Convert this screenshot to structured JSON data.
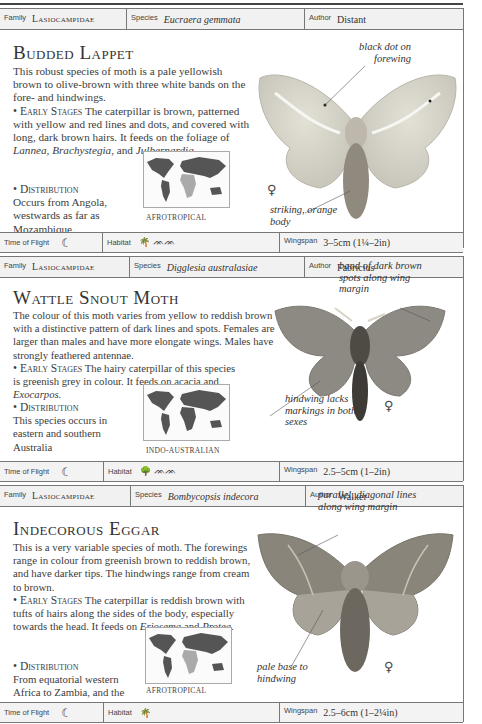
{
  "labels": {
    "family": "Family",
    "species": "Species",
    "author": "Author",
    "time_of_flight": "Time of Flight",
    "habitat": "Habitat",
    "wingspan": "Wingspan"
  },
  "entries": [
    {
      "family": "Lasiocampidae",
      "species": "Eucraera gemmata",
      "author": "Distant",
      "title": "Budded Lappet",
      "description": "This robust species of moth is a pale yellowish brown to olive-brown with three white bands on the fore- and hindwings.",
      "early_stages_heading": "• Early Stages",
      "early_stages_text_1": " The caterpillar is brown, patterned with yellow and red lines and dots, and covered with long, dark brown hairs. It feeds on the foliage of ",
      "early_stages_italic": "Lannea, Brachystegia,",
      "early_stages_text_2": " and ",
      "early_stages_italic_2": "Julbernardia.",
      "distribution_heading": "• Distribution",
      "distribution_text": "Occurs from Angola, westwards as far as Mozambique.",
      "map_label": "AFROTROPICAL",
      "annotations": [
        "black dot on forewing",
        "striking, orange body"
      ],
      "sex_symbol": "♀",
      "time_of_flight_icon": "☾",
      "habitat_icons": "🌴 ᨏᨏ",
      "wingspan": "3–5cm (1¼–2in)"
    },
    {
      "family": "Lasiocampidae",
      "species": "Digglesia australasiae",
      "author": "Fabricius",
      "title": "Wattle Snout Moth",
      "description": "The colour of this moth varies from yellow to reddish brown with a distinctive pattern of dark lines and spots. Females are larger than males and have more elongate wings. Males have strongly feathered antennae.",
      "early_stages_heading": "• Early Stages",
      "early_stages_text_1": " The hairy caterpillar of this species is greenish grey in colour. It feeds on acacia and ",
      "early_stages_italic": "Exocarpos.",
      "distribution_heading": "• Distribution",
      "distribution_text": "This species occurs in eastern and southern Australia",
      "map_label": "INDO-AUSTRALIAN",
      "annotations": [
        "band of dark brown spots along wing margin",
        "hindwing lacks markings in both sexes"
      ],
      "sex_symbol": "♀",
      "time_of_flight_icon": "☾",
      "habitat_icons": "🌳 ᨏᨏ",
      "wingspan": "2.5–5cm (1–2in)"
    },
    {
      "family": "Lasiocampidae",
      "species": "Bombycopsis indecora",
      "author": "Walker",
      "title": "Indecorous Eggar",
      "description": "This is a very variable species of moth. The forewings range in colour from greenish brown to reddish brown, and have darker tips. The hindwings range from cream to brown.",
      "early_stages_heading": "• Early Stages",
      "early_stages_text_1": " The caterpillar is reddish brown with tufts of hairs along the sides of the body, especially towards the head. It feeds on ",
      "early_stages_italic": "Eriosema",
      "early_stages_text_2": " and ",
      "early_stages_italic_2": "Protea.",
      "distribution_heading": "• Distribution",
      "distribution_text": "From equatorial western Africa to Zambia, and the Transvaal in South Africa.",
      "map_label": "AFROTROPICAL",
      "annotations": [
        "parallel, diagonal lines along wing margin",
        "pale base to hindwing"
      ],
      "sex_symbol": "♀",
      "time_of_flight_icon": "☾",
      "habitat_icons": "🌴",
      "wingspan": "2.5–6cm (1–2¼in)"
    }
  ]
}
